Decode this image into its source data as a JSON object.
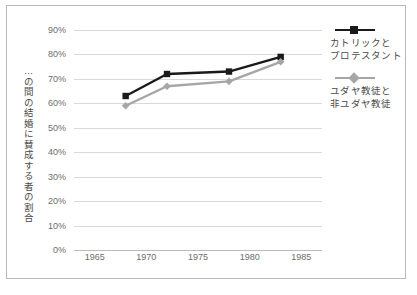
{
  "chart_data": {
    "type": "line",
    "title": "",
    "xlabel": "",
    "ylabel": "…の間の結婚に賛成する者の割合",
    "x": [
      1968,
      1972,
      1978,
      1983
    ],
    "xlim": [
      1963,
      1987
    ],
    "ylim": [
      0,
      90
    ],
    "grid": true,
    "legend_position": "right",
    "xticks": [
      "1965",
      "1970",
      "1975",
      "1980",
      "1985"
    ],
    "xtick_values": [
      1965,
      1970,
      1975,
      1980,
      1985
    ],
    "yticks": [
      "0%",
      "10%",
      "20%",
      "30%",
      "40%",
      "50%",
      "60%",
      "70%",
      "80%",
      "90%"
    ],
    "ytick_values": [
      0,
      10,
      20,
      30,
      40,
      50,
      60,
      70,
      80,
      90
    ],
    "series": [
      {
        "name": "カトリックとプロテスタント",
        "name_lines": [
          "カトリックと",
          "プロテスタント"
        ],
        "color": "#1a1a1a",
        "marker": "square",
        "values": [
          63,
          72,
          73,
          79
        ]
      },
      {
        "name": "ユダヤ教徒と非ユダヤ教徒",
        "name_lines": [
          "ユダヤ教徒と",
          "非ユダヤ教徒"
        ],
        "color": "#a6a6a6",
        "marker": "diamond",
        "values": [
          59,
          67,
          69,
          77
        ]
      }
    ]
  },
  "colors": {
    "series_black": "#1a1a1a",
    "series_gray": "#a6a6a6",
    "gridline": "#d9d9d9",
    "axis": "#bcbcbc",
    "border": "#b9b9b9",
    "tick_text": "#6d6d6d",
    "label_text": "#4a4a4a",
    "background": "#ffffff"
  }
}
